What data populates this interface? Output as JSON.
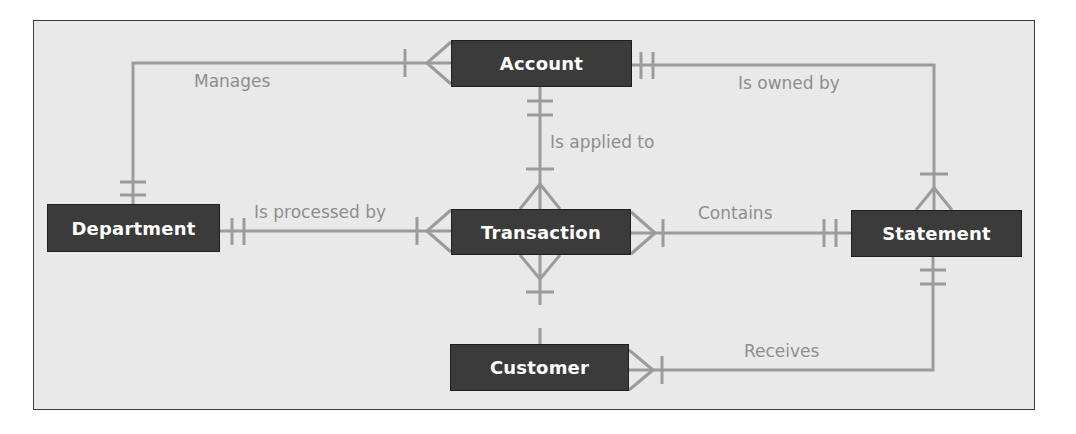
{
  "diagram": {
    "type": "entity-relationship",
    "colors": {
      "background": "#e9e9e9",
      "frame_border": "#3a3a3a",
      "entity_fill": "#3b3b3b",
      "entity_text": "#ffffff",
      "line": "#9b9b9b",
      "label_text": "#8e8e8e"
    },
    "entities": {
      "account": {
        "label": "Account"
      },
      "department": {
        "label": "Department"
      },
      "transaction": {
        "label": "Transaction"
      },
      "statement": {
        "label": "Statement"
      },
      "customer": {
        "label": "Customer"
      }
    },
    "relationships": [
      {
        "id": "manages",
        "label": "Manages",
        "from": "Department",
        "from_cardinality": "one-and-only-one",
        "to": "Account",
        "to_cardinality": "one-or-many"
      },
      {
        "id": "is-owned-by",
        "label": "Is owned by",
        "from": "Account",
        "from_cardinality": "one-and-only-one",
        "to": "Statement",
        "to_cardinality": "one-or-many"
      },
      {
        "id": "is-applied-to",
        "label": "Is applied to",
        "from": "Account",
        "from_cardinality": "one-and-only-one",
        "to": "Transaction",
        "to_cardinality": "one-or-many"
      },
      {
        "id": "is-processed-by",
        "label": "Is processed by",
        "from": "Department",
        "from_cardinality": "one-and-only-one",
        "to": "Transaction",
        "to_cardinality": "one-or-many"
      },
      {
        "id": "contains",
        "label": "Contains",
        "from": "Statement",
        "from_cardinality": "one-and-only-one",
        "to": "Transaction",
        "to_cardinality": "one-or-many"
      },
      {
        "id": "customer-transaction",
        "label": "",
        "from": "Customer",
        "from_cardinality": "unspecified",
        "to": "Transaction",
        "to_cardinality": "one-or-many"
      },
      {
        "id": "receives",
        "label": "Receives",
        "from": "Statement",
        "from_cardinality": "one-and-only-one",
        "to": "Customer",
        "to_cardinality": "one-or-many"
      }
    ]
  }
}
